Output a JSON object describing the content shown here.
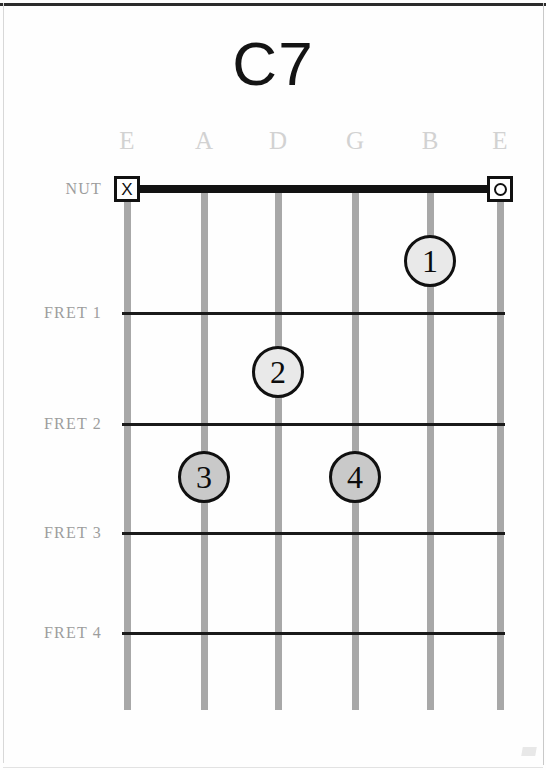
{
  "chord": {
    "name": "C7",
    "nut_label": "NUT"
  },
  "strings": [
    {
      "label": "E",
      "x": 127,
      "marker": "X",
      "marker_name": "muted-string-marker"
    },
    {
      "label": "A",
      "x": 204,
      "marker": null,
      "marker_name": null
    },
    {
      "label": "D",
      "x": 278,
      "marker": null,
      "marker_name": null
    },
    {
      "label": "G",
      "x": 355,
      "marker": null,
      "marker_name": null
    },
    {
      "label": "B",
      "x": 430,
      "marker": null,
      "marker_name": null
    },
    {
      "label": "E",
      "x": 500,
      "marker": "O",
      "marker_name": "open-string-marker"
    }
  ],
  "frets": [
    {
      "label": "NUT",
      "y": 189
    },
    {
      "label": "FRET 1",
      "y": 313
    },
    {
      "label": "FRET 2",
      "y": 424
    },
    {
      "label": "FRET 3",
      "y": 533
    },
    {
      "label": "FRET 4",
      "y": 633
    }
  ],
  "fingers": [
    {
      "number": "1",
      "string": "B",
      "fret": 1,
      "x": 430,
      "y": 261,
      "shade": "light"
    },
    {
      "number": "2",
      "string": "D",
      "fret": 2,
      "x": 278,
      "y": 372,
      "shade": "light"
    },
    {
      "number": "3",
      "string": "A",
      "fret": 3,
      "x": 204,
      "y": 477,
      "shade": "dark"
    },
    {
      "number": "4",
      "string": "G",
      "fret": 3,
      "x": 355,
      "y": 477,
      "shade": "dark"
    }
  ],
  "chart_data": {
    "type": "diagram",
    "title": "C7",
    "diagram_kind": "guitar-chord-chart",
    "string_names": [
      "E",
      "A",
      "D",
      "G",
      "B",
      "E"
    ],
    "fret_rows": [
      "NUT",
      "FRET 1",
      "FRET 2",
      "FRET 3",
      "FRET 4"
    ],
    "open_strings": [
      "E (high)"
    ],
    "muted_strings": [
      "E (low)"
    ],
    "finger_positions": [
      {
        "finger": 1,
        "string": "B",
        "fret": 1
      },
      {
        "finger": 2,
        "string": "D",
        "fret": 2
      },
      {
        "finger": 3,
        "string": "A",
        "fret": 3
      },
      {
        "finger": 4,
        "string": "G",
        "fret": 3
      }
    ],
    "colors": {
      "string": "#a8a8a8",
      "fret": "#1a1a1a",
      "nut": "#121212",
      "dot_light": "#e9e9e9",
      "dot_dark": "#c9c9c9",
      "label": "#9d9d9d",
      "string_label": "#d2d2d2",
      "title": "#141414"
    }
  }
}
